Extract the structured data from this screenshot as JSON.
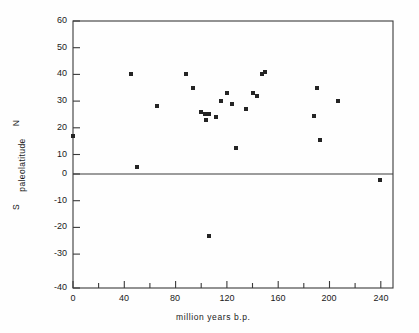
{
  "chart_data": {
    "type": "scatter",
    "title": "",
    "xlabel": "million years b.p.",
    "ylabel": "S   paleolatitude   N",
    "ylabel_parts": [
      "S",
      "paleolatitude",
      "N"
    ],
    "xlim": [
      0,
      250
    ],
    "ylim": [
      -40,
      60
    ],
    "xticks": [
      0,
      40,
      80,
      120,
      160,
      200,
      240
    ],
    "xticklabels": [
      "0",
      "40",
      "80",
      "120",
      "160",
      "200",
      "240"
    ],
    "xminorticks": [
      20,
      60,
      100,
      140,
      180,
      220
    ],
    "yticks": [
      -40,
      -30,
      -20,
      -10,
      0,
      10,
      20,
      30,
      40,
      50,
      60
    ],
    "yticklabels": [
      "-40",
      "-30",
      "-20",
      "-10",
      "0",
      "10",
      "20",
      "30",
      "40",
      "50",
      "60"
    ],
    "grid": false,
    "legend": null,
    "zero_line": 0,
    "marker_color": "#242424",
    "marker_shape": "square",
    "frame_color": "#333333",
    "points": [
      {
        "x": 0,
        "y": 17
      },
      {
        "x": 45,
        "y": 40
      },
      {
        "x": 50,
        "y": 5.5
      },
      {
        "x": 66,
        "y": 28
      },
      {
        "x": 88,
        "y": 40
      },
      {
        "x": 94,
        "y": 35
      },
      {
        "x": 100,
        "y": 26
      },
      {
        "x": 103,
        "y": 25
      },
      {
        "x": 105,
        "y": 25
      },
      {
        "x": 106,
        "y": 25
      },
      {
        "x": 104,
        "y": 23
      },
      {
        "x": 106,
        "y": -20.5
      },
      {
        "x": 112,
        "y": 24
      },
      {
        "x": 116,
        "y": 30
      },
      {
        "x": 120,
        "y": 33
      },
      {
        "x": 124,
        "y": 29
      },
      {
        "x": 127,
        "y": 12.5
      },
      {
        "x": 135,
        "y": 27
      },
      {
        "x": 141,
        "y": 33
      },
      {
        "x": 144,
        "y": 32
      },
      {
        "x": 148,
        "y": 40
      },
      {
        "x": 150,
        "y": 41
      },
      {
        "x": 188,
        "y": 24.5
      },
      {
        "x": 191,
        "y": 35
      },
      {
        "x": 193,
        "y": 15.5
      },
      {
        "x": 207,
        "y": 30
      },
      {
        "x": 240,
        "y": 0.5
      }
    ]
  },
  "axes": {
    "x_axis_label": "million years b.p.",
    "y_axis_label_south": "S",
    "y_axis_label_main": "paleolatitude",
    "y_axis_label_north": "N"
  }
}
